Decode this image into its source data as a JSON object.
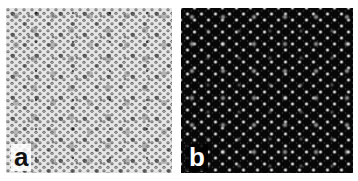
{
  "figure": {
    "panels": [
      {
        "id": "a",
        "label": "a",
        "description": "Dense hexagonal lattice pattern of gray dots on light background",
        "background_color": "#d8d8d8",
        "dot_color": "#555555",
        "label_color": "#111111"
      },
      {
        "id": "b",
        "label": "b",
        "description": "Bright dot lattice on dark background",
        "background_color": "#080808",
        "dot_color": "#e8e8e8",
        "label_color": "#ffffff"
      }
    ]
  }
}
